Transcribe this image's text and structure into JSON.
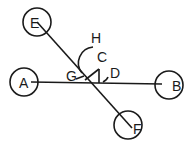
{
  "diagram": {
    "nodes": [
      {
        "id": "A",
        "label": "A",
        "cx": 24,
        "cy": 82,
        "r": 14
      },
      {
        "id": "B",
        "label": "B",
        "cx": 169,
        "cy": 85,
        "r": 14
      },
      {
        "id": "E",
        "label": "E",
        "cx": 37,
        "cy": 22,
        "r": 14
      },
      {
        "id": "F",
        "label": "F",
        "cx": 128,
        "cy": 125,
        "r": 14
      }
    ],
    "lines": [
      {
        "from": "A",
        "to": "B"
      },
      {
        "from": "E",
        "to": "F"
      }
    ],
    "angle_labels": {
      "C": "C",
      "D": "D",
      "G": "G",
      "H": "H"
    }
  }
}
